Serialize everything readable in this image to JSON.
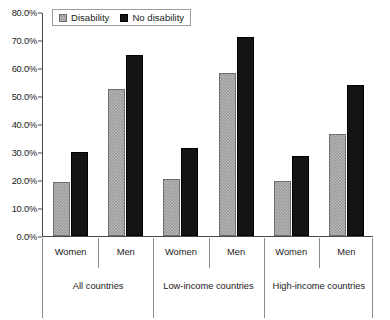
{
  "chart_data": {
    "type": "bar",
    "title": "",
    "subtitle": "",
    "xlabel": "",
    "ylabel": "",
    "ylim": [
      0,
      80
    ],
    "y_tick_labels": [
      "0.0%",
      "10.0%",
      "20.0%",
      "30.0%",
      "40.0%",
      "50.0%",
      "60.0%",
      "70.0%",
      "80.0%"
    ],
    "y_tick_values": [
      0,
      10,
      20,
      30,
      40,
      50,
      60,
      70,
      80
    ],
    "grid": false,
    "legend_position": "top-left",
    "categories": [
      "Women",
      "Men",
      "Women",
      "Men",
      "Women",
      "Men"
    ],
    "groups": [
      {
        "label": "All countries",
        "categories": [
          "Women",
          "Men"
        ]
      },
      {
        "label": "Low-income countries",
        "categories": [
          "Women",
          "Men"
        ]
      },
      {
        "label": "High-income countries",
        "categories": [
          "Women",
          "Men"
        ]
      }
    ],
    "series": [
      {
        "name": "Disability",
        "color": "#9a9a9a",
        "pattern": "checkered",
        "values": [
          19.4,
          52.5,
          20.2,
          58.3,
          19.5,
          36.3
        ]
      },
      {
        "name": "No disability",
        "color": "#141414",
        "pattern": "solid",
        "values": [
          30.1,
          64.7,
          31.5,
          71.1,
          28.5,
          53.8
        ]
      }
    ]
  },
  "legend": {
    "items": [
      {
        "label": "Disability",
        "swatch": "disability-swatch"
      },
      {
        "label": "No disability",
        "swatch": "no-disability-swatch"
      }
    ]
  },
  "axis": {
    "y_max_label": "80.0%",
    "y_min_label": "0.0%"
  }
}
